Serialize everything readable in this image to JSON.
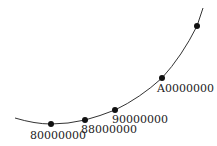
{
  "diagram": {
    "curve_color": "#333333",
    "point_color": "#111111",
    "points": [
      {
        "label": "80000000",
        "x": 51,
        "y": 124,
        "lx": 30,
        "ly": 139
      },
      {
        "label": "88000000",
        "x": 85,
        "y": 120,
        "lx": 81,
        "ly": 133
      },
      {
        "label": "90000000",
        "x": 115,
        "y": 110,
        "lx": 112,
        "ly": 123
      },
      {
        "label": "A0000000",
        "x": 162,
        "y": 78,
        "lx": 157,
        "ly": 92
      },
      {
        "label": "",
        "x": 197,
        "y": 26
      }
    ]
  }
}
